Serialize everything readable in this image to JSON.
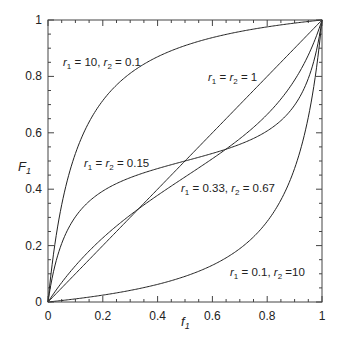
{
  "chart_data": {
    "type": "line",
    "title": "",
    "xlabel": "f1",
    "ylabel": "F1",
    "xlim": [
      0,
      1
    ],
    "ylim": [
      0,
      1
    ],
    "grid": false,
    "legend": "none (inline annotations)",
    "x_ticks": [
      "0",
      "0.2",
      "0.4",
      "0.6",
      "0.8",
      "1"
    ],
    "y_ticks": [
      "0",
      "0.2",
      "0.4",
      "0.6",
      "0.8",
      "1"
    ],
    "x": [
      0,
      0.1,
      0.2,
      0.3,
      0.4,
      0.5,
      0.6,
      0.7,
      0.8,
      0.9,
      1
    ],
    "series": [
      {
        "name": "r1 = 10, r2 = 0.1",
        "r1": 10,
        "r2": 0.1,
        "values": [
          0,
          0.526,
          0.714,
          0.811,
          0.87,
          0.909,
          0.938,
          0.959,
          0.976,
          0.989,
          1
        ]
      },
      {
        "name": "r1 = r2 = 1",
        "r1": 1,
        "r2": 1,
        "values": [
          0,
          0.1,
          0.2,
          0.3,
          0.4,
          0.5,
          0.6,
          0.7,
          0.8,
          0.9,
          1
        ]
      },
      {
        "name": "r1 = r2 = 0.15",
        "r1": 0.15,
        "r2": 0.15,
        "values": [
          0,
          0.302,
          0.393,
          0.441,
          0.473,
          0.5,
          0.527,
          0.559,
          0.607,
          0.698,
          1
        ]
      },
      {
        "name": "r1 = 0.33, r2 = 0.67",
        "r1": 0.33,
        "r2": 0.67,
        "values": [
          0,
          0.128,
          0.227,
          0.308,
          0.378,
          0.443,
          0.508,
          0.579,
          0.665,
          0.787,
          1
        ]
      },
      {
        "name": "r1 = 0.1, r2 = 10",
        "r1": 0.1,
        "r2": 10,
        "values": [
          0,
          0.011,
          0.024,
          0.041,
          0.063,
          0.091,
          0.13,
          0.189,
          0.286,
          0.474,
          1
        ]
      }
    ],
    "annotations": [
      {
        "text": "r1 = 10, r2 = 0.1",
        "parts": [
          [
            "r",
            "1",
            " = 10, "
          ],
          [
            "r",
            "2",
            " = 0.1"
          ]
        ],
        "x": 63,
        "y": 66
      },
      {
        "text": "r1 = r2 = 1",
        "parts": [
          [
            "r",
            "1",
            " = "
          ],
          [
            "r",
            "2",
            " = 1"
          ]
        ],
        "x": 208,
        "y": 81
      },
      {
        "text": "r1 = r2 = 0.15",
        "parts": [
          [
            "r",
            "1",
            " = "
          ],
          [
            "r",
            "2",
            " = 0.15"
          ]
        ],
        "x": 84,
        "y": 167
      },
      {
        "text": "r1 = 0.33, r2 = 0.67",
        "parts": [
          [
            "r",
            "1",
            " = 0.33, "
          ],
          [
            "r",
            "2",
            " = 0.67"
          ]
        ],
        "x": 181,
        "y": 192
      },
      {
        "text": "r1 = 0.1, r2 =10",
        "parts": [
          [
            "r",
            "1",
            " = 0.1, "
          ],
          [
            "r",
            "2",
            " =10"
          ]
        ],
        "x": 230,
        "y": 276
      }
    ],
    "colors": {
      "line": "#222222",
      "axis": "#444444",
      "text": "#222222"
    }
  }
}
